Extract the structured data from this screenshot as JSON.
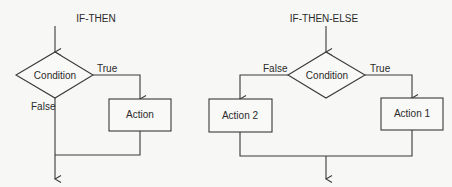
{
  "diagrams": [
    {
      "title": "IF-THEN",
      "decision": "Condition",
      "true_label": "True",
      "false_label": "False",
      "actions": [
        "Action"
      ]
    },
    {
      "title": "IF-THEN-ELSE",
      "decision": "Condition",
      "true_label": "True",
      "false_label": "False",
      "actions": [
        "Action 1",
        "Action 2"
      ]
    }
  ],
  "colors": {
    "line": "#3a3a3a",
    "text": "#2a2a2a",
    "background": "#f7f7f5"
  }
}
